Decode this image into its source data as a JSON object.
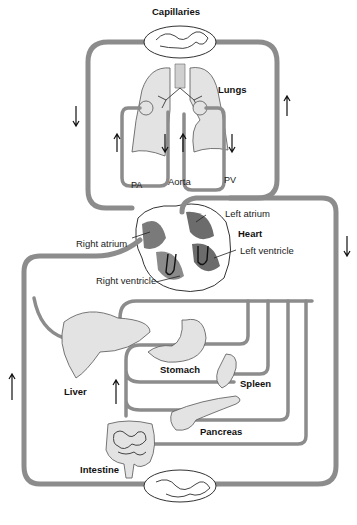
{
  "diagram": {
    "labels": {
      "capillaries": "Capillaries",
      "lungs": "Lungs",
      "pa": "PA",
      "aorta": "Aorta",
      "pv": "PV",
      "left_atrium": "Left atrium",
      "heart": "Heart",
      "right_atrium": "Right atrium",
      "left_ventricle": "Left ventricle",
      "right_ventricle": "Right ventricle",
      "liver": "Liver",
      "stomach": "Stomach",
      "spleen": "Spleen",
      "pancreas": "Pancreas",
      "intestine": "Intestine"
    },
    "flow_arrows": [
      {
        "location": "left-upper",
        "direction": "down"
      },
      {
        "location": "right-upper",
        "direction": "up"
      },
      {
        "location": "pulmonary-left-1",
        "direction": "up"
      },
      {
        "location": "pulmonary-left-2",
        "direction": "down"
      },
      {
        "location": "pulmonary-right-1",
        "direction": "up"
      },
      {
        "location": "pulmonary-right-2",
        "direction": "down"
      },
      {
        "location": "right-lower",
        "direction": "down"
      },
      {
        "location": "left-lower",
        "direction": "up"
      },
      {
        "location": "portal-vein",
        "direction": "up"
      }
    ],
    "colors": {
      "vessel": "#8c8c8c",
      "organ_fill": "#e3e3e3",
      "heart_chamber": "#7a7a7a"
    }
  }
}
